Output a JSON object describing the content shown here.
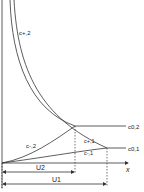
{
  "diagram": {
    "type": "concentration-profile-sketch",
    "axis": {
      "x_label": "x"
    },
    "curve_labels": {
      "c_plus_2": "c+,2",
      "c_minus_2": "c-,2",
      "c_zero_2": "c0,2",
      "c_plus_1": "c+,1",
      "c_minus_1": "c-,1",
      "c_zero_1": "c0,1"
    },
    "dimension_labels": {
      "u2": "U2",
      "u1": "U1"
    },
    "colors": {
      "line": "#333333",
      "background": "#ffffff"
    }
  }
}
